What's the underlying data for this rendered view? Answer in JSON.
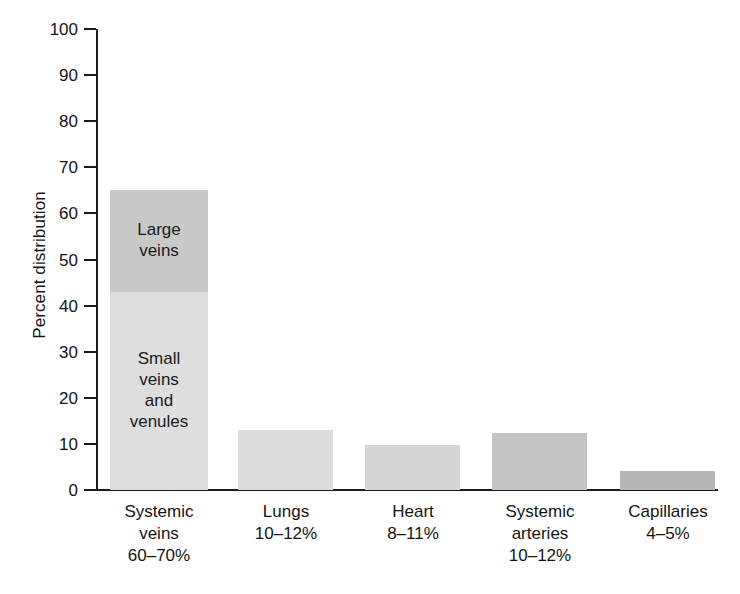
{
  "chart_data": {
    "type": "bar",
    "title": "",
    "subtitle": "",
    "xlabel": "",
    "ylabel": "Percent distribution",
    "ylim": [
      0,
      100
    ],
    "ytick_step": 10,
    "yticks": [
      100,
      90,
      80,
      70,
      60,
      50,
      40,
      30,
      20,
      10,
      0
    ],
    "ytick_labels": [
      "100",
      "90",
      "80",
      "70",
      "60",
      "50",
      "40",
      "30",
      "20",
      "10",
      "0"
    ],
    "grid": false,
    "legend": "none",
    "stacked": true,
    "categories": [
      "Systemic\nveins\n60–70%",
      "Lungs\n10–12%",
      "Heart\n8–11%",
      "Systemic\narteries\n10–12%",
      "Capillaries\n4–5%"
    ],
    "category_names": [
      "Systemic veins",
      "Lungs",
      "Heart",
      "Systemic arteries",
      "Capillaries"
    ],
    "category_ranges": [
      "60–70%",
      "10–12%",
      "8–11%",
      "10–12%",
      "4–5%"
    ],
    "values": [
      65,
      13,
      9.8,
      12.3,
      4.2
    ],
    "bars": [
      {
        "name": "Systemic veins",
        "total": 65,
        "segments": [
          {
            "label": "Large\nveins",
            "value": 22,
            "from": 43,
            "to": 65,
            "color": "#c9c9c9"
          },
          {
            "label": "Small\nveins\nand\nvenules",
            "value": 43,
            "from": 0,
            "to": 43,
            "color": "#dedede"
          }
        ]
      },
      {
        "name": "Lungs",
        "total": 13,
        "segments": [
          {
            "label": "",
            "value": 13,
            "from": 0,
            "to": 13,
            "color": "#dcdcdc"
          }
        ]
      },
      {
        "name": "Heart",
        "total": 9.8,
        "segments": [
          {
            "label": "",
            "value": 9.8,
            "from": 0,
            "to": 9.8,
            "color": "#d6d6d6"
          }
        ]
      },
      {
        "name": "Systemic arteries",
        "total": 12.3,
        "segments": [
          {
            "label": "",
            "value": 12.3,
            "from": 0,
            "to": 12.3,
            "color": "#c4c4c4"
          }
        ]
      },
      {
        "name": "Capillaries",
        "total": 4.2,
        "segments": [
          {
            "label": "",
            "value": 4.2,
            "from": 0,
            "to": 4.2,
            "color": "#b6b6b6"
          }
        ]
      }
    ],
    "segment_labels": [
      "Large veins",
      "Small veins and venules"
    ],
    "colors": {
      "axis": "#1a1a1a",
      "text": "#141414",
      "background": "#ffffff",
      "large_veins": "#c9c9c9",
      "small_veins": "#dedede",
      "lungs": "#dcdcdc",
      "heart": "#d6d6d6",
      "systemic_arteries": "#c4c4c4",
      "capillaries": "#b6b6b6"
    }
  }
}
